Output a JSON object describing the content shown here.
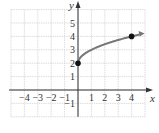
{
  "chart_data": {
    "type": "line",
    "title": "",
    "xlabel": "x",
    "ylabel": "y",
    "xlim": [
      -5,
      5
    ],
    "ylim": [
      -2,
      6
    ],
    "grid": true,
    "x_ticks": [
      "-4",
      "-3",
      "-2",
      "-1",
      "1",
      "2",
      "3",
      "4"
    ],
    "y_ticks": [
      "-1",
      "1",
      "2",
      "3",
      "4",
      "5"
    ],
    "series": [
      {
        "name": "y = sqrt(x) + 2",
        "function": "sqrt(x) + 2",
        "x": [
          0,
          0.25,
          0.5,
          1,
          1.5,
          2,
          2.5,
          3,
          3.5,
          4,
          4.6
        ],
        "y": [
          2,
          2.5,
          2.71,
          3,
          3.22,
          3.41,
          3.58,
          3.73,
          3.87,
          4,
          4.14
        ],
        "color": "#777777",
        "end_arrow": true
      }
    ],
    "points": [
      {
        "x": 0,
        "y": 2,
        "filled": true
      },
      {
        "x": 4,
        "y": 4,
        "filled": true
      }
    ]
  },
  "labels": {
    "x_axis": "x",
    "y_axis": "y",
    "x_ticks": [
      {
        "v": -4,
        "t": "−4"
      },
      {
        "v": -3,
        "t": "−3"
      },
      {
        "v": -2,
        "t": "−2"
      },
      {
        "v": -1,
        "t": "−1"
      },
      {
        "v": 1,
        "t": "1"
      },
      {
        "v": 2,
        "t": "2"
      },
      {
        "v": 3,
        "t": "3"
      },
      {
        "v": 4,
        "t": "4"
      }
    ],
    "y_ticks": [
      {
        "v": -1,
        "t": "−1"
      },
      {
        "v": 1,
        "t": "1"
      },
      {
        "v": 2,
        "t": "2"
      },
      {
        "v": 3,
        "t": "3"
      },
      {
        "v": 4,
        "t": "4"
      },
      {
        "v": 5,
        "t": "5"
      }
    ]
  },
  "colors": {
    "grid": "#d4d4d4",
    "axis": "#333333",
    "curve": "#7a7a7a",
    "point": "#111111"
  }
}
